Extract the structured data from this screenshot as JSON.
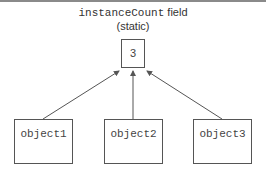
{
  "label": {
    "field_name": "instanceCount",
    "field_suffix": " field",
    "qualifier": "(static)"
  },
  "static_box": {
    "value": "3"
  },
  "objects": [
    {
      "label": "object1"
    },
    {
      "label": "object2"
    },
    {
      "label": "object3"
    }
  ],
  "colors": {
    "stroke": "#555555",
    "text": "#333333"
  }
}
